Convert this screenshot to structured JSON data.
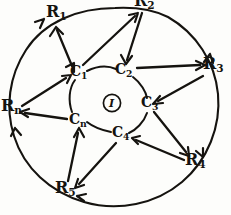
{
  "figure": {
    "ink_color": "#15130f",
    "background_color": "#fdfdfb",
    "style": "hand-drawn"
  },
  "center": {
    "label_text": "I",
    "label_base": "I",
    "label_sub": "",
    "name": "center-node-i"
  },
  "inner_ring": {
    "radius": 40,
    "nodes": [
      {
        "id": "C1",
        "base": "C",
        "sub": "1",
        "x": 78,
        "y": 73,
        "angle_deg": 215
      },
      {
        "id": "C2",
        "base": "C",
        "sub": "2",
        "x": 123,
        "y": 71,
        "angle_deg": 287
      },
      {
        "id": "C3",
        "base": "C",
        "sub": "3",
        "x": 148,
        "y": 104,
        "angle_deg": 2
      },
      {
        "id": "C4",
        "base": "C",
        "sub": "4",
        "x": 120,
        "y": 134,
        "angle_deg": 69
      },
      {
        "id": "Cn",
        "base": "C",
        "sub": "n",
        "x": 77,
        "y": 121,
        "angle_deg": 143
      }
    ]
  },
  "outer_ring": {
    "radius": 100,
    "nodes": [
      {
        "id": "R1",
        "base": "R",
        "sub": "1",
        "x": 53,
        "y": 12,
        "angle_deg": 243
      },
      {
        "id": "R2",
        "base": "R",
        "sub": "2",
        "x": 141,
        "y": 2,
        "angle_deg": 295,
        "clipped_top": true
      },
      {
        "id": "R3",
        "base": "R",
        "sub": "3",
        "x": 207,
        "y": 65,
        "angle_deg": 350
      },
      {
        "id": "R4",
        "base": "R",
        "sub": "4",
        "x": 190,
        "y": 160,
        "angle_deg": 52
      },
      {
        "id": "R5",
        "base": "R",
        "sub": "5",
        "x": 62,
        "y": 188,
        "angle_deg": 108
      },
      {
        "id": "Rn",
        "base": "R",
        "sub": "n",
        "x": 6,
        "y": 106,
        "angle_deg": 178
      }
    ]
  },
  "edges": [
    {
      "from": "C1",
      "to": "R1",
      "type": "double-arrow"
    },
    {
      "from": "C1",
      "to": "R2",
      "type": "arrow"
    },
    {
      "from": "R2",
      "to": "C2",
      "type": "arrow"
    },
    {
      "from": "C2",
      "to": "R3",
      "type": "arrow"
    },
    {
      "from": "R3",
      "to": "C3",
      "type": "arrow"
    },
    {
      "from": "C3",
      "to": "R4",
      "type": "arrow"
    },
    {
      "from": "R4",
      "to": "C4",
      "type": "arrow"
    },
    {
      "from": "C4",
      "to": "R5",
      "type": "arrow"
    },
    {
      "from": "R5",
      "to": "Cn",
      "type": "arrow"
    },
    {
      "from": "Cn",
      "to": "Rn",
      "type": "arrow"
    },
    {
      "from": "Rn",
      "to": "C1",
      "type": "arrow"
    }
  ],
  "outer_arcs": [
    {
      "from": "Rn",
      "to": "R1",
      "type": "arc-arrow"
    },
    {
      "from": "R1",
      "to": "R2",
      "type": "arc-arrow"
    },
    {
      "from": "R2",
      "to": "R3",
      "type": "arc-arrow"
    },
    {
      "from": "R3",
      "to": "R4",
      "type": "arc-arrow"
    },
    {
      "from": "R4",
      "to": "R5",
      "type": "arc-arrow"
    },
    {
      "from": "R5",
      "to": "Rn",
      "type": "arc-arrow"
    }
  ]
}
